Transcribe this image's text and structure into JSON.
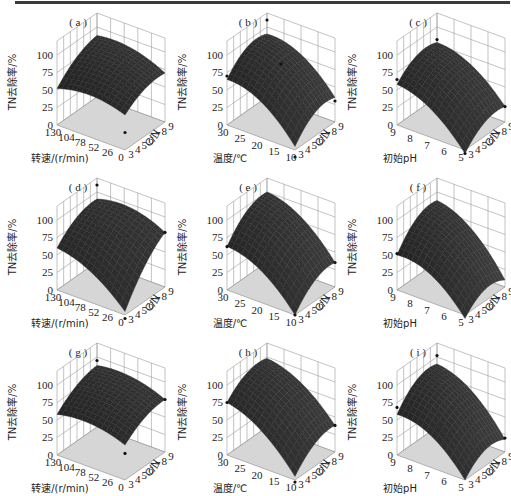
{
  "figure": {
    "panels": [
      "a",
      "b",
      "c",
      "d",
      "e",
      "f",
      "g",
      "h",
      "i"
    ]
  },
  "chart_data": [
    {
      "type": "surface3d",
      "label": "(a)",
      "xlabel": "转速/(r/min)",
      "ylabel": "C/N",
      "zlabel": "TN去除率/%",
      "x_ticks": [
        "130",
        "104",
        "78",
        "52",
        "26",
        "0"
      ],
      "y_ticks": [
        "3",
        "4",
        "5",
        "6",
        "7",
        "8",
        "9"
      ],
      "z_ticks": [
        "0",
        "25",
        "50",
        "75",
        "100"
      ],
      "xlim": [
        0,
        130
      ],
      "ylim": [
        3,
        9
      ],
      "zlim": [
        0,
        100
      ],
      "corners": {
        "x_high_y_low": 52,
        "x_high_y_high": 88,
        "x_low_y_high": 70,
        "x_low_y_low": 50
      },
      "peak": 90,
      "points": [
        {
          "x": 0,
          "y": 3,
          "z": 25
        }
      ]
    },
    {
      "type": "surface3d",
      "label": "(b)",
      "xlabel": "温度/℃",
      "ylabel": "C/N",
      "zlabel": "TN去除率/%",
      "x_ticks": [
        "30",
        "25",
        "20",
        "15",
        "10"
      ],
      "y_ticks": [
        "3",
        "4",
        "5",
        "6",
        "7",
        "8",
        "9"
      ],
      "z_ticks": [
        "0",
        "25",
        "50",
        "75",
        "100"
      ],
      "xlim": [
        10,
        30
      ],
      "ylim": [
        3,
        9
      ],
      "zlim": [
        0,
        100
      ],
      "corners": {
        "x_high_y_low": 65,
        "x_high_y_high": 90,
        "x_low_y_high": 35,
        "x_low_y_low": 5
      },
      "peak": 98,
      "points": [
        {
          "x": 30,
          "y": 3,
          "z": 70
        },
        {
          "x": 30,
          "y": 9,
          "z": 110
        },
        {
          "x": 20,
          "y": 6,
          "z": 85
        },
        {
          "x": 10,
          "y": 9,
          "z": 30
        },
        {
          "x": 10,
          "y": 3,
          "z": -10
        }
      ]
    },
    {
      "type": "surface3d",
      "label": "(c)",
      "xlabel": "初始pH",
      "ylabel": "C/N",
      "zlabel": "TN去除率/%",
      "x_ticks": [
        "9",
        "8",
        "7",
        "6",
        "5"
      ],
      "y_ticks": [
        "3",
        "4",
        "5",
        "6",
        "7",
        "8",
        "9"
      ],
      "z_ticks": [
        "0",
        "25",
        "50",
        "75",
        "100"
      ],
      "xlim": [
        5,
        9
      ],
      "ylim": [
        3,
        9
      ],
      "zlim": [
        0,
        100
      ],
      "corners": {
        "x_high_y_low": 58,
        "x_high_y_high": 78,
        "x_low_y_high": 22,
        "x_low_y_low": -5
      },
      "peak": 82,
      "points": [
        {
          "x": 9,
          "y": 3,
          "z": 65
        },
        {
          "x": 9,
          "y": 9,
          "z": 82
        },
        {
          "x": 5,
          "y": 9,
          "z": 22
        },
        {
          "x": 5,
          "y": 3,
          "z": -5
        }
      ]
    },
    {
      "type": "surface3d",
      "label": "(d)",
      "xlabel": "转速/(r/min)",
      "ylabel": "C/N",
      "zlabel": "TN去除率/%",
      "x_ticks": [
        "130",
        "104",
        "78",
        "52",
        "26",
        "0"
      ],
      "y_ticks": [
        "3",
        "4",
        "5",
        "6",
        "7",
        "8",
        "9"
      ],
      "z_ticks": [
        "0",
        "25",
        "50",
        "75",
        "100"
      ],
      "xlim": [
        0,
        130
      ],
      "ylim": [
        3,
        9
      ],
      "zlim": [
        0,
        100
      ],
      "corners": {
        "x_high_y_low": 60,
        "x_high_y_high": 90,
        "x_low_y_high": 78,
        "x_low_y_low": 5
      },
      "peak": 92,
      "points": [
        {
          "x": 130,
          "y": 9,
          "z": 110
        },
        {
          "x": 0,
          "y": 9,
          "z": 78
        },
        {
          "x": 0,
          "y": 3,
          "z": -5
        }
      ]
    },
    {
      "type": "surface3d",
      "label": "(e)",
      "xlabel": "温度/℃",
      "ylabel": "C/N",
      "zlabel": "TN去除率/%",
      "x_ticks": [
        "30",
        "25",
        "20",
        "15",
        "10"
      ],
      "y_ticks": [
        "3",
        "4",
        "5",
        "6",
        "7",
        "8",
        "9"
      ],
      "z_ticks": [
        "0",
        "25",
        "50",
        "75",
        "100"
      ],
      "xlim": [
        10,
        30
      ],
      "ylim": [
        3,
        9
      ],
      "zlim": [
        0,
        100
      ],
      "corners": {
        "x_high_y_low": 62,
        "x_high_y_high": 100,
        "x_low_y_high": 35,
        "x_low_y_low": 0
      },
      "peak": 100,
      "points": [
        {
          "x": 30,
          "y": 3,
          "z": 62
        },
        {
          "x": 10,
          "y": 9,
          "z": 35
        },
        {
          "x": 10,
          "y": 3,
          "z": 0
        }
      ]
    },
    {
      "type": "surface3d",
      "label": "(f)",
      "xlabel": "初始pH",
      "ylabel": "C/N",
      "zlabel": "TN去除率/%",
      "x_ticks": [
        "9",
        "8",
        "7",
        "6",
        "5"
      ],
      "y_ticks": [
        "3",
        "4",
        "5",
        "6",
        "7",
        "8",
        "9"
      ],
      "z_ticks": [
        "0",
        "25",
        "50",
        "75",
        "100"
      ],
      "xlim": [
        5,
        9
      ],
      "ylim": [
        3,
        9
      ],
      "zlim": [
        0,
        100
      ],
      "corners": {
        "x_high_y_low": 50,
        "x_high_y_high": 88,
        "x_low_y_high": 10,
        "x_low_y_low": -5
      },
      "peak": 92,
      "points": [
        {
          "x": 9,
          "y": 3,
          "z": 52
        }
      ]
    },
    {
      "type": "surface3d",
      "label": "(g)",
      "xlabel": "转速/(r/min)",
      "ylabel": "C/N",
      "zlabel": "TN去除率/%",
      "x_ticks": [
        "130",
        "104",
        "78",
        "52",
        "26",
        "0"
      ],
      "y_ticks": [
        "3",
        "4",
        "5",
        "6",
        "7",
        "8",
        "9"
      ],
      "z_ticks": [
        "0",
        "25",
        "50",
        "75",
        "100"
      ],
      "xlim": [
        0,
        130
      ],
      "ylim": [
        3,
        9
      ],
      "zlim": [
        0,
        100
      ],
      "corners": {
        "x_high_y_low": 58,
        "x_high_y_high": 88,
        "x_low_y_high": 75,
        "x_low_y_low": 50
      },
      "peak": 90,
      "points": [
        {
          "x": 130,
          "y": 9,
          "z": 95
        },
        {
          "x": 0,
          "y": 9,
          "z": 75
        },
        {
          "x": 0,
          "y": 3,
          "z": 38
        }
      ]
    },
    {
      "type": "surface3d",
      "label": "(h)",
      "xlabel": "温度/℃",
      "ylabel": "C/N",
      "zlabel": "TN去除率/%",
      "x_ticks": [
        "30",
        "25",
        "20",
        "15",
        "10"
      ],
      "y_ticks": [
        "3",
        "4",
        "5",
        "6",
        "7",
        "8",
        "9"
      ],
      "z_ticks": [
        "0",
        "25",
        "50",
        "75",
        "100"
      ],
      "xlim": [
        10,
        30
      ],
      "ylim": [
        3,
        9
      ],
      "zlim": [
        0,
        100
      ],
      "corners": {
        "x_high_y_low": 75,
        "x_high_y_high": 98,
        "x_low_y_high": 38,
        "x_low_y_low": 5
      },
      "peak": 98,
      "points": [
        {
          "x": 30,
          "y": 3,
          "z": 75
        },
        {
          "x": 10,
          "y": 9,
          "z": 38
        },
        {
          "x": 10,
          "y": 3,
          "z": -3
        }
      ]
    },
    {
      "type": "surface3d",
      "label": "(i)",
      "xlabel": "初始pH",
      "ylabel": "C/N",
      "zlabel": "TN去除率/%",
      "x_ticks": [
        "9",
        "8",
        "7",
        "6",
        "5"
      ],
      "y_ticks": [
        "3",
        "4",
        "5",
        "6",
        "7",
        "8",
        "9"
      ],
      "z_ticks": [
        "0",
        "25",
        "50",
        "75",
        "100"
      ],
      "xlim": [
        5,
        9
      ],
      "ylim": [
        3,
        9
      ],
      "zlim": [
        0,
        100
      ],
      "corners": {
        "x_high_y_low": 58,
        "x_high_y_high": 90,
        "x_low_y_high": 18,
        "x_low_y_low": 0
      },
      "peak": 95,
      "points": [
        {
          "x": 9,
          "y": 3,
          "z": 68
        },
        {
          "x": 9,
          "y": 9,
          "z": 102
        },
        {
          "x": 5,
          "y": 9,
          "z": 20
        }
      ]
    }
  ]
}
